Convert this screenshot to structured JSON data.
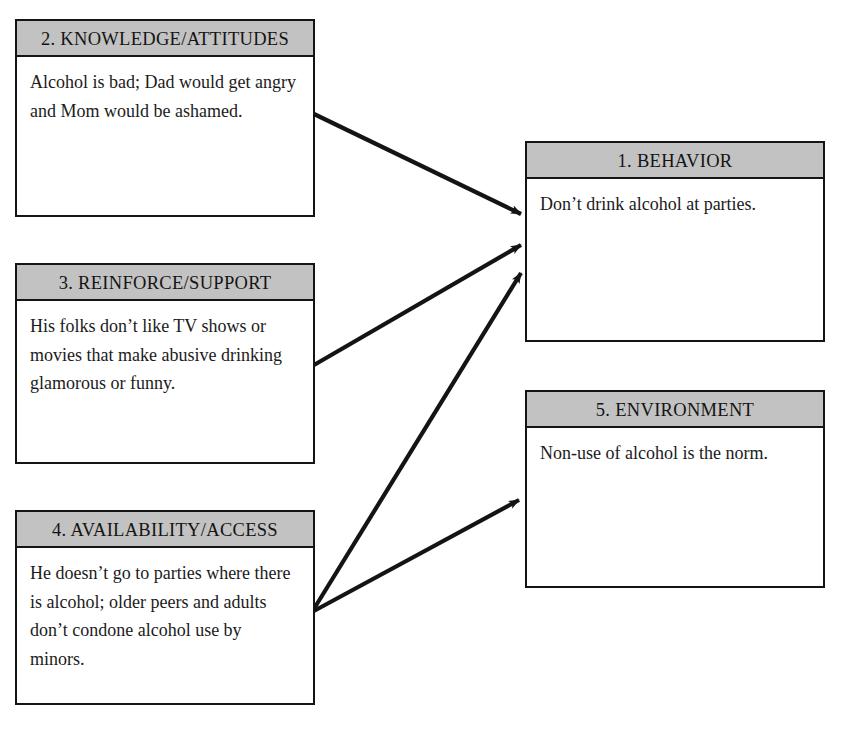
{
  "diagram": {
    "background_color": "#ffffff",
    "header_fill": "#c2c2c2",
    "line_color": "#141414",
    "nodes": [
      {
        "id": "behavior",
        "number": "1",
        "header": "1. BEHAVIOR",
        "body": "Don’t drink alcohol at parties.",
        "x": 525,
        "y": 141,
        "w": 300,
        "h": 201
      },
      {
        "id": "knowledge-attitudes",
        "number": "2",
        "header": "2. KNOWLEDGE/ATTITUDES",
        "body": "Alcohol is bad; Dad would get angry and Mom would be ashamed.",
        "x": 15,
        "y": 19,
        "w": 300,
        "h": 198
      },
      {
        "id": "reinforce-support",
        "number": "3",
        "header": "3. REINFORCE/SUPPORT",
        "body": "His folks don’t like TV shows or movies that make abusive drinking glamorous or funny.",
        "x": 15,
        "y": 263,
        "w": 300,
        "h": 201
      },
      {
        "id": "availability-access",
        "number": "4",
        "header": "4. AVAILABILITY/ACCESS",
        "body": "He doesn’t go to parties where there is alcohol; older peers and adults don’t condone alcohol use by minors.",
        "x": 15,
        "y": 510,
        "w": 300,
        "h": 195
      },
      {
        "id": "environment",
        "number": "5",
        "header": "5. ENVIRONMENT",
        "body": "Non-use of alcohol is the norm.",
        "x": 525,
        "y": 390,
        "w": 300,
        "h": 198
      }
    ],
    "arrows": [
      {
        "id": "knowledge-to-behavior",
        "from": "knowledge-attitudes",
        "to": "behavior",
        "x1": 314,
        "y1": 114,
        "x2": 521,
        "y2": 214
      },
      {
        "id": "reinforce-to-behavior",
        "from": "reinforce-support",
        "to": "behavior",
        "x1": 314,
        "y1": 365,
        "x2": 521,
        "y2": 245
      },
      {
        "id": "availability-to-behavior",
        "from": "availability-access",
        "to": "behavior",
        "x1": 312,
        "y1": 612,
        "x2": 521,
        "y2": 273
      },
      {
        "id": "availability-to-environment",
        "from": "availability-access",
        "to": "environment",
        "x1": 312,
        "y1": 612,
        "x2": 519,
        "y2": 500
      }
    ]
  }
}
